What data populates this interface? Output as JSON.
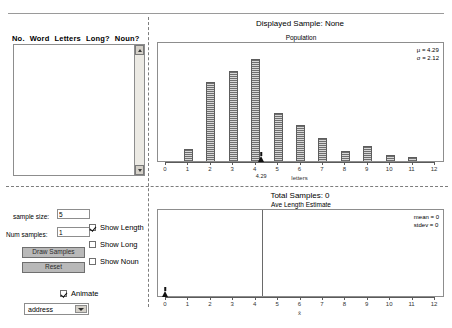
{
  "left_panel": {
    "table_headers": [
      "No.",
      "Word",
      "Letters",
      "Long?",
      "Noun?"
    ],
    "sample_size_label": "sample size:",
    "sample_size_value": "5",
    "num_samples_label": "Num samples:",
    "num_samples_value": "1",
    "draw_samples_label": "Draw Samples",
    "reset_label": "Reset",
    "checkboxes": [
      {
        "label": "Show Length",
        "checked": true
      },
      {
        "label": "Show Long",
        "checked": false
      },
      {
        "label": "Show Noun",
        "checked": false
      }
    ],
    "animate_label": "Animate",
    "animate_checked": true,
    "dropdown_value": "address"
  },
  "header": {
    "displayed_sample": "Displayed Sample: None",
    "total_samples": "Total Samples: 0"
  },
  "population_chart": {
    "title": "Population",
    "mu_text": "μ = 4.29",
    "sigma_text": "σ = 2.12"
  },
  "estimate_chart": {
    "title": "Ave Length Estimate",
    "mean_text": "mean = 0",
    "stdev_text": "stdev = 0"
  },
  "chart_data": [
    {
      "type": "bar",
      "title": "Population",
      "xlabel": "letters",
      "ylabel": "",
      "xlim": [
        0,
        12
      ],
      "ylim": [
        0,
        1
      ],
      "grid": false,
      "categories": [
        "0",
        "1",
        "2",
        "3",
        "4",
        "5",
        "6",
        "7",
        "8",
        "9",
        "10",
        "11",
        "12"
      ],
      "values": [
        0,
        0.11,
        0.73,
        0.83,
        0.94,
        0.44,
        0.33,
        0.21,
        0.09,
        0.14,
        0.06,
        0.04,
        0
      ],
      "tick_labels": [
        "0",
        "1",
        "2",
        "3",
        "4",
        "5",
        "6",
        "7",
        "8",
        "9",
        "10",
        "11",
        "12"
      ],
      "annotations": [
        {
          "text": "4.29",
          "x": 4.29,
          "kind": "mean-marker"
        },
        {
          "text": "μ = 4.29",
          "kind": "stat"
        },
        {
          "text": "σ = 2.12",
          "kind": "stat"
        }
      ]
    },
    {
      "type": "bar",
      "title": "Ave Length Estimate",
      "xlabel": "x̄",
      "ylabel": "",
      "xlim": [
        0,
        12
      ],
      "ylim": [
        0,
        1
      ],
      "grid": false,
      "categories": [
        "0",
        "1",
        "2",
        "3",
        "4",
        "5",
        "6",
        "7",
        "8",
        "9",
        "10",
        "11",
        "12"
      ],
      "values": [
        0,
        0,
        0,
        0,
        0,
        0,
        0,
        0,
        0,
        0,
        0,
        0,
        0
      ],
      "tick_labels": [
        "0",
        "1",
        "2",
        "3",
        "4",
        "5",
        "6",
        "7",
        "8",
        "9",
        "10",
        "11",
        "12"
      ],
      "annotations": [
        {
          "text": "mean = 0",
          "kind": "stat"
        },
        {
          "text": "stdev = 0",
          "kind": "stat"
        },
        {
          "text": "",
          "x": 4.29,
          "kind": "vertical-line"
        },
        {
          "text": "",
          "x": 0,
          "kind": "mean-marker"
        }
      ]
    }
  ]
}
